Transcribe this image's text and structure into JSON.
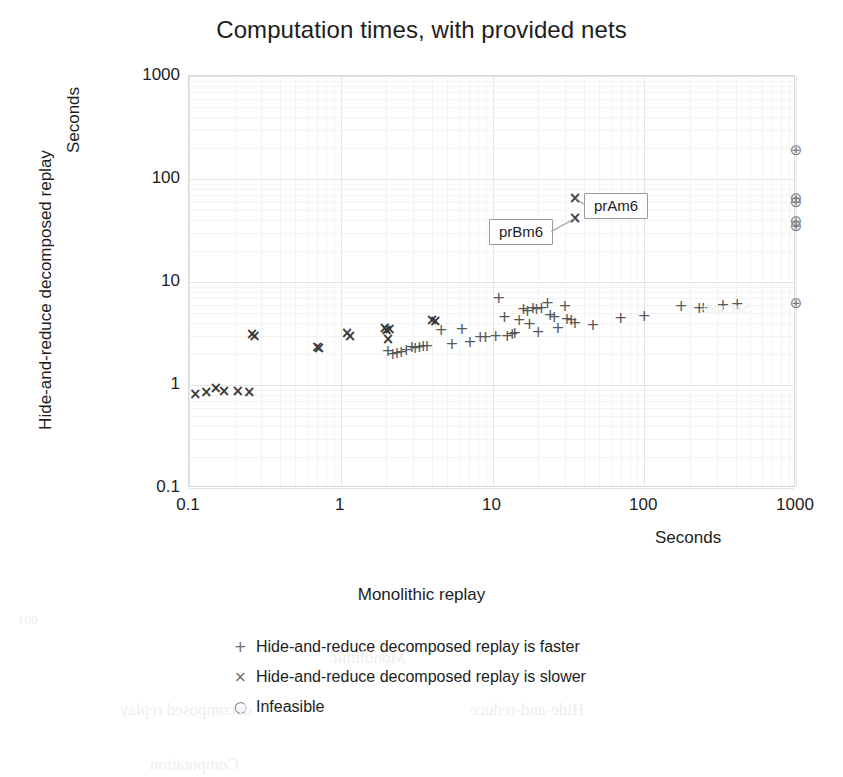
{
  "chart_data": {
    "type": "scatter",
    "title": "Computation times, with provided nets",
    "xlabel": "Monolithic replay",
    "xlabel_units": "Seconds",
    "ylabel": "Hide-and-reduce decomposed replay",
    "ylabel_units": "Seconds",
    "xscale": "log",
    "yscale": "log",
    "xlim": [
      0.1,
      1000
    ],
    "ylim": [
      0.1,
      1000
    ],
    "xticks": [
      "0.1",
      "1",
      "10",
      "100",
      "1000"
    ],
    "yticks": [
      "0.1",
      "1",
      "10",
      "100",
      "1000"
    ],
    "grid": true,
    "legend_position": "below",
    "series": [
      {
        "name": "Hide-and-reduce decomposed replay is faster",
        "marker": "plus",
        "points": [
          [
            2.05,
            2.15
          ],
          [
            2.2,
            2.0
          ],
          [
            2.35,
            2.05
          ],
          [
            2.5,
            2.1
          ],
          [
            2.7,
            2.2
          ],
          [
            2.95,
            2.35
          ],
          [
            3.1,
            2.3
          ],
          [
            3.3,
            2.35
          ],
          [
            3.5,
            2.4
          ],
          [
            3.7,
            2.4
          ],
          [
            4.6,
            3.4
          ],
          [
            5.4,
            2.5
          ],
          [
            6.3,
            3.5
          ],
          [
            7.1,
            2.6
          ],
          [
            8.3,
            2.9
          ],
          [
            9.0,
            2.9
          ],
          [
            10.5,
            3.0
          ],
          [
            11.0,
            7.0
          ],
          [
            12.0,
            4.6
          ],
          [
            12.5,
            3.0
          ],
          [
            13.5,
            3.1
          ],
          [
            14.0,
            3.2
          ],
          [
            15.0,
            4.3
          ],
          [
            16.0,
            5.5
          ],
          [
            17.0,
            5.2
          ],
          [
            17.5,
            3.9
          ],
          [
            18.5,
            5.6
          ],
          [
            19.5,
            5.5
          ],
          [
            20.0,
            3.3
          ],
          [
            21.0,
            5.6
          ],
          [
            23.0,
            6.3
          ],
          [
            24.0,
            4.8
          ],
          [
            25.5,
            4.6
          ],
          [
            27.0,
            3.6
          ],
          [
            30.0,
            5.9
          ],
          [
            31.0,
            4.4
          ],
          [
            33.0,
            4.3
          ],
          [
            35.0,
            4.0
          ],
          [
            46.0,
            3.8
          ],
          [
            70.0,
            4.5
          ],
          [
            100.0,
            4.7
          ],
          [
            175.0,
            5.8
          ],
          [
            230.0,
            5.6
          ],
          [
            245.0,
            5.6
          ],
          [
            330.0,
            6.0
          ],
          [
            410.0,
            6.1
          ]
        ]
      },
      {
        "name": "Hide-and-reduce decomposed replay is slower",
        "marker": "cross",
        "points": [
          [
            0.11,
            0.82
          ],
          [
            0.13,
            0.85
          ],
          [
            0.15,
            0.93
          ],
          [
            0.17,
            0.88
          ],
          [
            0.21,
            0.87
          ],
          [
            0.25,
            0.86
          ],
          [
            0.26,
            3.1
          ],
          [
            0.27,
            3.0
          ],
          [
            0.7,
            2.35
          ],
          [
            0.72,
            2.3
          ],
          [
            1.1,
            3.2
          ],
          [
            1.15,
            3.0
          ],
          [
            1.95,
            3.6
          ],
          [
            2.0,
            3.4
          ],
          [
            2.05,
            2.8
          ],
          [
            2.1,
            3.5
          ],
          [
            4.0,
            4.3
          ],
          [
            4.2,
            4.2
          ],
          [
            35.0,
            65.0
          ],
          [
            35.0,
            42.0
          ]
        ],
        "labeled_points": [
          {
            "label": "prAm6",
            "x": 35.0,
            "y": 65.0
          },
          {
            "label": "prBm6",
            "x": 35.0,
            "y": 42.0
          }
        ]
      },
      {
        "name": "Infeasible",
        "marker": "circle",
        "points": [
          [
            1000,
            190
          ],
          [
            1000,
            66
          ],
          [
            1000,
            60
          ],
          [
            1000,
            39
          ],
          [
            1000,
            35
          ],
          [
            1000,
            6.3
          ]
        ]
      }
    ]
  },
  "legend": {
    "items": [
      {
        "marker": "+",
        "label": "Hide-and-reduce decomposed replay is faster"
      },
      {
        "marker": "×",
        "label": "Hide-and-reduce decomposed replay is slower"
      },
      {
        "marker": "○",
        "label": "Infeasible"
      }
    ]
  },
  "bleed_through": [
    {
      "text": "001",
      "left": 18,
      "top": 612,
      "size": 13
    },
    {
      "text": "Monolithic",
      "left": 330,
      "top": 648,
      "size": 17
    },
    {
      "text": "Seconds",
      "left": 700,
      "top": 300,
      "size": 15
    },
    {
      "text": "decomposed replay",
      "left": 120,
      "top": 700,
      "size": 17
    },
    {
      "text": "Hide-and-reduce",
      "left": 470,
      "top": 700,
      "size": 17
    },
    {
      "text": "Computation",
      "left": 150,
      "top": 755,
      "size": 17
    }
  ]
}
